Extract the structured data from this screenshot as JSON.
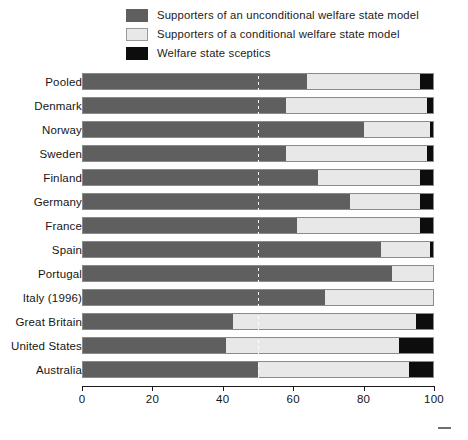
{
  "legend": {
    "position": "top",
    "items": [
      {
        "label": "Supporters of an unconditional welfare state model",
        "color": "#5f5f5f",
        "key": "unconditional"
      },
      {
        "label": "Supporters of a conditional welfare state model",
        "color": "#e8e8e8",
        "key": "conditional"
      },
      {
        "label": "Welfare state sceptics",
        "color": "#0d0d0d",
        "key": "sceptics"
      }
    ]
  },
  "chart_data": {
    "type": "bar",
    "orientation": "horizontal",
    "stacked": true,
    "stack_total": 100,
    "title": "",
    "subtitle": "",
    "xlabel": "",
    "ylabel": "",
    "xlim": [
      0,
      100
    ],
    "ylim": null,
    "grid": false,
    "xticks": [
      0,
      20,
      40,
      60,
      80,
      100
    ],
    "xtick_labels": [
      "0",
      "20",
      "40",
      "60",
      "80",
      "100"
    ],
    "reference_line": {
      "value": 50,
      "style": "dashed",
      "color": "#ffffff"
    },
    "legend_position": "top",
    "categories": [
      "Pooled",
      "Denmark",
      "Norway",
      "Sweden",
      "Finland",
      "Germany",
      "France",
      "Spain",
      "Portugal",
      "Italy (1996)",
      "Great Britain",
      "United States",
      "Australia"
    ],
    "series": [
      {
        "name": "Supporters of an unconditional welfare state model",
        "color": "#5f5f5f",
        "values": [
          64,
          58,
          80,
          58,
          67,
          76,
          61,
          85,
          88,
          69,
          43,
          41,
          50
        ]
      },
      {
        "name": "Supporters of a conditional welfare state model",
        "color": "#e8e8e8",
        "values": [
          32,
          40,
          19,
          40,
          29,
          20,
          35,
          14,
          12,
          31,
          52,
          49,
          43
        ]
      },
      {
        "name": "Welfare state sceptics",
        "color": "#0d0d0d",
        "values": [
          4,
          2,
          1,
          2,
          4,
          4,
          4,
          1,
          0,
          0,
          5,
          10,
          7
        ]
      }
    ]
  }
}
